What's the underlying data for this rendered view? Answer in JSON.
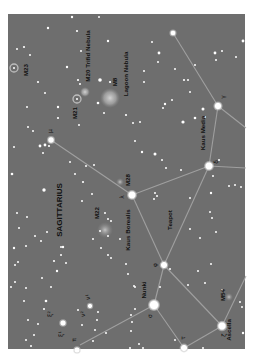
{
  "chart_data": {
    "type": "star-chart",
    "title": "Sagittarius",
    "orientation": "rotated-90-ccw",
    "colors": {
      "background": "#6e6e6e",
      "frame_outer": "#ffffff",
      "star": "#ffffff",
      "constellation_line": "#a8a8a8",
      "label": "#111111",
      "nebula": "#bdbdbd"
    },
    "frame": {
      "x": 8,
      "y": 14,
      "width": 237,
      "height": 335
    },
    "constellation_label": {
      "text": "SAGITTARIUS",
      "x": 62,
      "y": 210
    },
    "asterism_label": {
      "text": "Teapot",
      "x": 172,
      "y": 222
    },
    "named_stars": [
      {
        "id": "kaus-media",
        "name": "Kaus Media",
        "greek": "δ",
        "x": 209,
        "y": 166,
        "r": 4.2
      },
      {
        "id": "kaus-borealis",
        "name": "Kaus Borealis",
        "greek": "λ",
        "x": 132,
        "y": 195,
        "r": 4.2
      },
      {
        "id": "phi",
        "name": "",
        "greek": "φ",
        "x": 164,
        "y": 265,
        "r": 3.6
      },
      {
        "id": "nunki",
        "name": "Nunki",
        "greek": "σ",
        "x": 154,
        "y": 305,
        "r": 5.2
      },
      {
        "id": "tau",
        "name": "",
        "greek": "τ",
        "x": 184,
        "y": 348,
        "r": 3.6
      },
      {
        "id": "ascella",
        "name": "Ascella",
        "greek": "ζ",
        "x": 222,
        "y": 326,
        "r": 4.4
      },
      {
        "id": "gamma",
        "name": "",
        "greek": "γ",
        "x": 218,
        "y": 106,
        "r": 3.8
      },
      {
        "id": "mu",
        "name": "",
        "greek": "μ",
        "x": 51,
        "y": 140,
        "r": 3.2
      },
      {
        "id": "xi2",
        "name": "",
        "greek": "ξ²",
        "x": 63,
        "y": 323,
        "r": 3.0
      },
      {
        "id": "omicron",
        "name": "",
        "greek": "ο",
        "x": 77,
        "y": 350,
        "r": 3.0
      },
      {
        "id": "nu1",
        "name": "",
        "greek": "ν¹",
        "x": 90,
        "y": 306,
        "r": 2.4
      },
      {
        "id": "eta-top",
        "name": "",
        "greek": "",
        "x": 173,
        "y": 33,
        "r": 2.8
      }
    ],
    "lines": [
      [
        "kaus-media",
        "kaus-borealis"
      ],
      [
        "kaus-media",
        "phi"
      ],
      [
        "kaus-borealis",
        "phi"
      ],
      [
        "phi",
        "nunki"
      ],
      [
        "phi",
        "ascella"
      ],
      [
        "nunki",
        "tau"
      ],
      [
        "tau",
        "ascella"
      ],
      [
        "kaus-media",
        "gamma"
      ],
      [
        "kaus-borealis",
        "mu"
      ],
      [
        "gamma",
        "eta-top"
      ]
    ],
    "open_lines": [
      {
        "x1": 218,
        "y1": 106,
        "x2": 246,
        "y2": 128
      },
      {
        "x1": 209,
        "y1": 166,
        "x2": 246,
        "y2": 168
      },
      {
        "x1": 222,
        "y1": 326,
        "x2": 246,
        "y2": 276
      },
      {
        "x1": 154,
        "y1": 305,
        "x2": 80,
        "y2": 345
      }
    ],
    "deep_sky": [
      {
        "id": "m8",
        "label": "M8",
        "sublabel": "Lagoon Nebula",
        "x": 110,
        "y": 98,
        "type": "nebula",
        "r": 10
      },
      {
        "id": "m20",
        "label": "M20",
        "sublabel": "Trifid Nebula",
        "x": 85,
        "y": 92,
        "type": "nebula",
        "r": 5
      },
      {
        "id": "m21",
        "label": "M21",
        "sublabel": "",
        "x": 77,
        "y": 99,
        "type": "open-cluster",
        "r": 4
      },
      {
        "id": "m23",
        "label": "M23",
        "sublabel": "",
        "x": 14,
        "y": 68,
        "type": "open-cluster",
        "r": 4
      },
      {
        "id": "m28",
        "label": "M28",
        "sublabel": "",
        "x": 120,
        "y": 182,
        "type": "globular",
        "r": 4
      },
      {
        "id": "m22",
        "label": "M22",
        "sublabel": "",
        "x": 105,
        "y": 230,
        "type": "globular",
        "r": 8
      },
      {
        "id": "m54",
        "label": "M54",
        "sublabel": "",
        "x": 229,
        "y": 297,
        "type": "globular",
        "r": 4
      }
    ],
    "labels": [
      {
        "text": "M23",
        "x": 28,
        "y": 70
      },
      {
        "text": "M21",
        "x": 77,
        "y": 113
      },
      {
        "text": "M20 Trifid Nebula",
        "x": 90,
        "y": 56
      },
      {
        "text": "M8",
        "x": 117,
        "y": 82
      },
      {
        "text": "Lagoon Nebula",
        "x": 128,
        "y": 74
      },
      {
        "text": "M28",
        "x": 130,
        "y": 180
      },
      {
        "text": "M22",
        "x": 99,
        "y": 213
      },
      {
        "text": "SAGITTARIUS",
        "x": 62,
        "y": 210
      },
      {
        "text": "Kaus Borealis",
        "x": 130,
        "y": 230
      },
      {
        "text": "Teapot",
        "x": 172,
        "y": 220
      },
      {
        "text": "Kaus Media",
        "x": 205,
        "y": 133
      },
      {
        "text": "Nunki",
        "x": 146,
        "y": 290
      },
      {
        "text": "M54",
        "x": 225,
        "y": 295
      },
      {
        "text": "Ascella",
        "x": 231,
        "y": 330
      }
    ],
    "greek_labels": [
      {
        "text": "γ",
        "x": 225,
        "y": 97
      },
      {
        "text": "δ",
        "x": 218,
        "y": 162
      },
      {
        "text": "λ",
        "x": 124,
        "y": 197
      },
      {
        "text": "μ",
        "x": 52,
        "y": 131
      },
      {
        "text": "φ",
        "x": 157,
        "y": 265
      },
      {
        "text": "σ",
        "x": 152,
        "y": 316
      },
      {
        "text": "τ",
        "x": 185,
        "y": 338
      },
      {
        "text": "ζ",
        "x": 226,
        "y": 335
      },
      {
        "text": "ξ²",
        "x": 52,
        "y": 314
      },
      {
        "text": "ξ¹",
        "x": 63,
        "y": 334
      },
      {
        "text": "ν¹",
        "x": 90,
        "y": 297
      },
      {
        "text": "ν²",
        "x": 85,
        "y": 314
      },
      {
        "text": "π",
        "x": 76,
        "y": 340
      }
    ],
    "field_stars": [
      [
        72,
        17,
        1.2
      ],
      [
        99,
        17,
        1.0
      ],
      [
        48,
        28,
        1.2
      ],
      [
        77,
        31,
        1.1
      ],
      [
        108,
        41,
        1.2
      ],
      [
        17,
        49,
        1.0
      ],
      [
        24,
        47,
        1.1
      ],
      [
        81,
        51,
        1.0
      ],
      [
        30,
        55,
        1.0
      ],
      [
        67,
        67,
        1.2
      ],
      [
        100,
        80,
        1.8
      ],
      [
        110,
        82,
        1.1
      ],
      [
        38,
        82,
        1.1
      ],
      [
        45,
        93,
        1.0
      ],
      [
        78,
        80,
        1.1
      ],
      [
        80,
        84,
        1.0
      ],
      [
        58,
        107,
        1.2
      ],
      [
        58,
        118,
        1.1
      ],
      [
        98,
        103,
        1.3
      ],
      [
        104,
        113,
        1.0
      ],
      [
        27,
        107,
        1.0
      ],
      [
        79,
        125,
        1.0
      ],
      [
        33,
        131,
        1.0
      ],
      [
        40,
        146,
        1.4
      ],
      [
        45,
        145,
        1.4
      ],
      [
        49,
        146,
        1.1
      ],
      [
        43,
        153,
        1.0
      ],
      [
        28,
        127,
        1.0
      ],
      [
        14,
        147,
        1.0
      ],
      [
        12,
        174,
        1.3
      ],
      [
        44,
        190,
        1.7
      ],
      [
        86,
        166,
        1.0
      ],
      [
        94,
        165,
        1.0
      ],
      [
        142,
        152,
        1.2
      ],
      [
        155,
        154,
        1.5
      ],
      [
        162,
        160,
        1.0
      ],
      [
        166,
        168,
        1.0
      ],
      [
        181,
        170,
        1.0
      ],
      [
        135,
        141,
        1.0
      ],
      [
        140,
        122,
        1.0
      ],
      [
        126,
        115,
        1.1
      ],
      [
        133,
        123,
        1.0
      ],
      [
        159,
        53,
        1.4
      ],
      [
        158,
        62,
        1.0
      ],
      [
        152,
        42,
        1.0
      ],
      [
        144,
        71,
        1.0
      ],
      [
        144,
        82,
        1.0
      ],
      [
        165,
        104,
        1.2
      ],
      [
        163,
        108,
        1.0
      ],
      [
        172,
        100,
        1.0
      ],
      [
        183,
        122,
        1.6
      ],
      [
        195,
        118,
        1.3
      ],
      [
        203,
        109,
        1.5
      ],
      [
        205,
        117,
        1.0
      ],
      [
        215,
        53,
        1.4
      ],
      [
        216,
        60,
        1.0
      ],
      [
        222,
        51,
        1.0
      ],
      [
        236,
        57,
        1.0
      ],
      [
        243,
        41,
        1.4
      ],
      [
        188,
        80,
        1.0
      ],
      [
        190,
        92,
        1.0
      ],
      [
        184,
        80,
        1.1
      ],
      [
        195,
        65,
        1.0
      ],
      [
        175,
        69,
        1.0
      ],
      [
        213,
        176,
        1.0
      ],
      [
        219,
        160,
        1.0
      ],
      [
        235,
        185,
        1.0
      ],
      [
        229,
        186,
        1.0
      ],
      [
        241,
        187,
        1.0
      ],
      [
        157,
        196,
        1.0
      ],
      [
        155,
        193,
        1.0
      ],
      [
        154,
        199,
        1.0
      ],
      [
        190,
        198,
        1.0
      ],
      [
        211,
        193,
        1.2
      ],
      [
        212,
        218,
        1.0
      ],
      [
        210,
        212,
        1.0
      ],
      [
        200,
        238,
        1.0
      ],
      [
        190,
        229,
        1.0
      ],
      [
        216,
        232,
        1.0
      ],
      [
        198,
        271,
        1.0
      ],
      [
        211,
        264,
        1.0
      ],
      [
        188,
        285,
        1.0
      ],
      [
        205,
        283,
        1.0
      ],
      [
        222,
        290,
        1.0
      ],
      [
        240,
        302,
        1.0
      ],
      [
        242,
        307,
        1.0
      ],
      [
        243,
        333,
        1.2
      ],
      [
        203,
        348,
        1.0
      ],
      [
        175,
        340,
        1.0
      ],
      [
        135,
        309,
        1.0
      ],
      [
        131,
        315,
        1.0
      ],
      [
        132,
        322,
        1.0
      ],
      [
        131,
        331,
        1.0
      ],
      [
        139,
        344,
        1.0
      ],
      [
        160,
        287,
        1.0
      ],
      [
        170,
        269,
        1.0
      ],
      [
        135,
        287,
        1.0
      ],
      [
        108,
        255,
        1.0
      ],
      [
        111,
        258,
        1.0
      ],
      [
        101,
        248,
        1.0
      ],
      [
        108,
        236,
        1.0
      ],
      [
        111,
        221,
        1.0
      ],
      [
        100,
        231,
        1.0
      ],
      [
        93,
        239,
        1.0
      ],
      [
        82,
        201,
        1.0
      ],
      [
        92,
        194,
        1.0
      ],
      [
        105,
        213,
        1.0
      ],
      [
        108,
        219,
        1.0
      ],
      [
        70,
        162,
        1.0
      ],
      [
        75,
        174,
        1.0
      ],
      [
        83,
        182,
        1.1
      ],
      [
        63,
        247,
        1.2
      ],
      [
        61,
        255,
        1.0
      ],
      [
        54,
        261,
        1.1
      ],
      [
        61,
        247,
        1.0
      ],
      [
        66,
        263,
        1.0
      ],
      [
        46,
        301,
        1.3
      ],
      [
        44,
        309,
        1.1
      ],
      [
        26,
        288,
        1.0
      ],
      [
        24,
        301,
        1.0
      ],
      [
        28,
        320,
        1.0
      ],
      [
        38,
        324,
        1.0
      ],
      [
        34,
        335,
        1.0
      ],
      [
        31,
        346,
        1.0
      ],
      [
        26,
        340,
        1.0
      ],
      [
        42,
        278,
        1.0
      ],
      [
        51,
        287,
        1.0
      ],
      [
        15,
        282,
        1.0
      ],
      [
        18,
        262,
        1.0
      ],
      [
        11,
        287,
        1.0
      ],
      [
        14,
        248,
        1.2
      ],
      [
        17,
        213,
        1.0
      ],
      [
        19,
        228,
        1.0
      ],
      [
        27,
        217,
        1.0
      ],
      [
        15,
        265,
        1.0
      ],
      [
        26,
        246,
        1.0
      ],
      [
        35,
        236,
        1.0
      ],
      [
        41,
        241,
        1.0
      ],
      [
        47,
        232,
        1.0
      ],
      [
        97,
        320,
        1.0
      ],
      [
        95,
        330,
        1.0
      ],
      [
        93,
        341,
        1.0
      ],
      [
        82,
        325,
        1.0
      ],
      [
        78,
        310,
        1.0
      ],
      [
        106,
        333,
        1.0
      ],
      [
        98,
        312,
        1.0
      ],
      [
        57,
        271,
        1.2
      ],
      [
        126,
        264,
        1.0
      ],
      [
        128,
        274,
        1.0
      ],
      [
        120,
        239,
        1.0
      ],
      [
        134,
        286,
        1.0
      ],
      [
        143,
        348,
        1.0
      ],
      [
        130,
        348,
        1.0
      ]
    ]
  }
}
